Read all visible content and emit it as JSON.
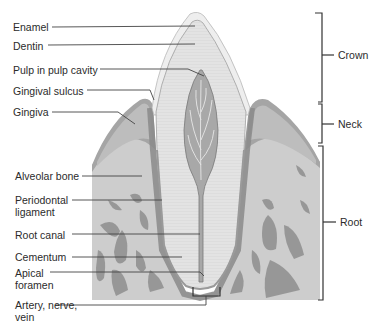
{
  "figure": {
    "type": "anatomical-diagram"
  },
  "labels_left": [
    {
      "text": "Enamel",
      "x": 13,
      "y": 21
    },
    {
      "text": "Dentin",
      "x": 13,
      "y": 40
    },
    {
      "text": "Pulp in pulp cavity",
      "x": 13,
      "y": 64
    },
    {
      "text": "Gingival sulcus",
      "x": 13,
      "y": 85
    },
    {
      "text": "Gingiva",
      "x": 13,
      "y": 106
    },
    {
      "text": "Alveolar bone",
      "x": 15,
      "y": 170
    },
    {
      "text": "Periodontal ligament",
      "x": 15,
      "y": 194
    },
    {
      "text": "Root canal",
      "x": 15,
      "y": 229
    },
    {
      "text": "Cementum",
      "x": 15,
      "y": 253
    },
    {
      "text": "Apical foramen",
      "x": 15,
      "y": 268
    },
    {
      "text": "Artery, nerve, vein",
      "x": 15,
      "y": 299
    }
  ],
  "labels_right": [
    {
      "text": "Crown",
      "x": 338,
      "y": 49
    },
    {
      "text": "Neck",
      "x": 338,
      "y": 119
    },
    {
      "text": "Root",
      "x": 340,
      "y": 216
    }
  ],
  "brackets": [
    {
      "name": "Crown",
      "top": 13,
      "bottom": 102
    },
    {
      "name": "Neck",
      "top": 104,
      "bottom": 143
    },
    {
      "name": "Root",
      "top": 146,
      "bottom": 300
    }
  ],
  "colors": {
    "background": "#ffffff",
    "enamel": "#ececec",
    "dentin": "#e1e1e1",
    "pulp": "#a9a9a9",
    "gingiva": "#9d9d9d",
    "bone_light": "#cfcfcf",
    "bone_dark": "#8a8a8a",
    "text": "#2b2b2b"
  }
}
